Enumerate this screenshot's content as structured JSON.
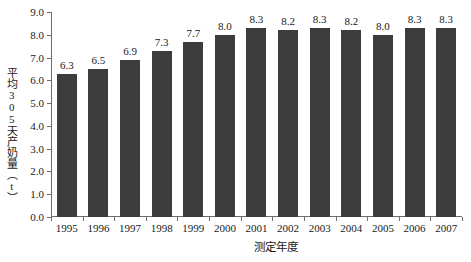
{
  "chart_data": {
    "type": "bar",
    "title": "",
    "subtitle": "",
    "xlabel": "测定年度",
    "ylabel": "平均305天产奶量（t）",
    "categories": [
      "1995",
      "1996",
      "1997",
      "1998",
      "1999",
      "2000",
      "2001",
      "2002",
      "2003",
      "2004",
      "2005",
      "2006",
      "2007"
    ],
    "values": [
      6.3,
      6.5,
      6.9,
      7.3,
      7.7,
      8.0,
      8.3,
      8.2,
      8.3,
      8.2,
      8.0,
      8.3,
      8.3
    ],
    "data_labels": [
      "6.3",
      "6.5",
      "6.9",
      "7.3",
      "7.7",
      "8.0",
      "8.3",
      "8.2",
      "8.3",
      "8.2",
      "8.0",
      "8.3",
      "8.3"
    ],
    "ylim": [
      0.0,
      9.0
    ],
    "ytick_values": [
      0.0,
      1.0,
      2.0,
      3.0,
      4.0,
      5.0,
      6.0,
      7.0,
      8.0,
      9.0
    ],
    "ytick_labels": [
      "0.0",
      "1.0",
      "2.0",
      "3.0",
      "4.0",
      "5.0",
      "6.0",
      "7.0",
      "8.0",
      "9.0"
    ],
    "grid": false,
    "legend": null,
    "legend_position": "none",
    "bar_color": "#3c3c3c",
    "axis_color": "#6d6d6d",
    "background_color": "#ffffff",
    "text_color": "#1a1a1a"
  }
}
